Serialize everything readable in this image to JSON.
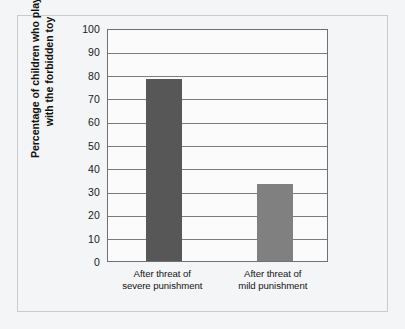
{
  "chart_data": {
    "type": "bar",
    "title": "",
    "subtitle": "",
    "xlabel": "",
    "ylabel": "Percentage of children who played with the forbidden toy",
    "ylabel_line1": "Percentage of children who played",
    "ylabel_line2": "with the forbidden toy",
    "categories": [
      "After threat of severe punishment",
      "After threat of mild punishment"
    ],
    "category_lines": [
      [
        "After threat of",
        "severe punishment"
      ],
      [
        "After threat of",
        "mild punishment"
      ]
    ],
    "values": [
      78,
      33
    ],
    "ylim": [
      0,
      100
    ],
    "yticks": [
      0,
      10,
      20,
      30,
      40,
      50,
      60,
      70,
      80,
      90,
      100
    ],
    "ytick_labels": [
      "0",
      "10",
      "20",
      "30",
      "40",
      "50",
      "60",
      "70",
      "80",
      "90",
      "100"
    ],
    "grid": true,
    "grid_axis": "y",
    "legend": false,
    "legend_position": "none",
    "bar_colors": [
      "#575757",
      "#808080"
    ],
    "annotations": []
  },
  "style": {
    "page_background": "#ffffff",
    "figure_background": "#f4f5f6",
    "plot_background": "#fbfbfc",
    "frame_color": "#c9cbcc",
    "axis_color": "#6e7173",
    "gridline_color": "#7a7d7f",
    "text_color": "#141414"
  }
}
